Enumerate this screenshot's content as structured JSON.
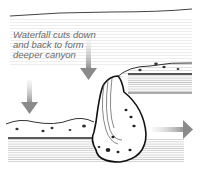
{
  "diagram": {
    "caption_lines": [
      "Waterfall cuts down",
      "and back to form",
      "deeper canyon"
    ],
    "colors": {
      "arrow": "#8a8a8a",
      "ink": "#222222",
      "hatch": "#bdbdbd",
      "background": "#ffffff"
    },
    "arrows": [
      {
        "name": "down-arrow-left",
        "direction": "down"
      },
      {
        "name": "down-arrow-center",
        "direction": "down"
      },
      {
        "name": "right-arrow",
        "direction": "right"
      }
    ]
  }
}
